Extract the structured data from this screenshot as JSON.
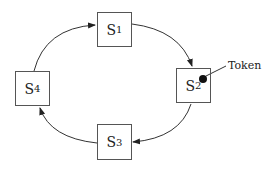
{
  "diagram": {
    "nodes": [
      {
        "id": "S1",
        "base": "S",
        "sub": "1"
      },
      {
        "id": "S2",
        "base": "S",
        "sub": "2"
      },
      {
        "id": "S3",
        "base": "S",
        "sub": "3"
      },
      {
        "id": "S4",
        "base": "S",
        "sub": "4"
      }
    ],
    "edges": [
      {
        "from": "S1",
        "to": "S2"
      },
      {
        "from": "S2",
        "to": "S3"
      },
      {
        "from": "S3",
        "to": "S4"
      },
      {
        "from": "S4",
        "to": "S1"
      }
    ],
    "token": {
      "label": "Token",
      "at": "S2"
    }
  }
}
